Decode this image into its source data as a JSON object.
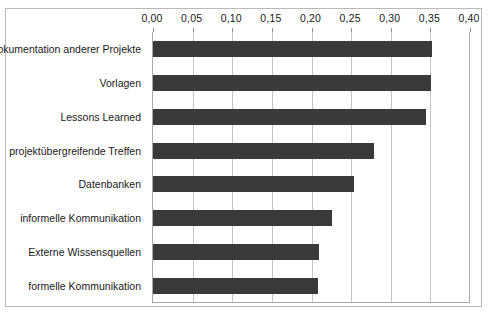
{
  "chart_data": {
    "type": "bar",
    "orientation": "horizontal",
    "title": "",
    "subtitle": "",
    "xlabel": "",
    "ylabel": "",
    "xlim": [
      0.0,
      0.4
    ],
    "xtick_step": 0.05,
    "xticks": [
      0.0,
      0.05,
      0.1,
      0.15,
      0.2,
      0.25,
      0.3,
      0.35,
      0.4
    ],
    "xtick_labels": [
      "0,00",
      "0,05",
      "0,10",
      "0,15",
      "0,20",
      "0,25",
      "0,30",
      "0,35",
      "0,40"
    ],
    "grid": true,
    "grid_axis": "x",
    "legend": false,
    "legend_position": "none",
    "decimal_separator": ",",
    "bar_color": "#3a3a3a",
    "grid_color": "#c4c4c4",
    "axis_color": "#a8a8a8",
    "frame_color": "#b9b9b9",
    "categories": [
      "Dokumentation anderer Projekte",
      "Vorlagen",
      "Lessons Learned",
      "projektübergreifende Treffen",
      "Datenbanken",
      "informelle Kommunikation",
      "Externe Wissensquellen",
      "formelle Kommunikation"
    ],
    "values": [
      0.352,
      0.351,
      0.344,
      0.279,
      0.254,
      0.226,
      0.209,
      0.208
    ],
    "series": [
      {
        "name": "Anteil",
        "values": [
          0.352,
          0.351,
          0.344,
          0.279,
          0.254,
          0.226,
          0.209,
          0.208
        ]
      }
    ]
  }
}
